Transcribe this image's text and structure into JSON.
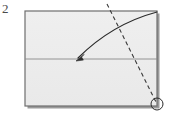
{
  "figure": {
    "type": "origami-instruction-diagram",
    "step_number": "2",
    "title": "",
    "background_color": "#ffffff"
  },
  "paper": {
    "name": "rectangular-sheet",
    "fill_color": "#ececec",
    "outline_color": "#6e6e6e",
    "outline_width": 1.2,
    "shadow_color": "#9a9a9a",
    "x": 25,
    "y": 11,
    "width": 132,
    "height": 95
  },
  "fold_line": {
    "name": "existing-horizontal-crease",
    "color": "#8a8a8a",
    "width": 0.9,
    "x1": 25,
    "y1": 59,
    "x2": 157,
    "y2": 59
  },
  "crease_line": {
    "name": "dashed-valley-fold-line",
    "style": "dashed",
    "color": "#3a3a3a",
    "width": 1.1,
    "dash_pattern": "4 3",
    "x1": 107,
    "y1": 4,
    "x2": 157,
    "y2": 104
  },
  "fold_arrow": {
    "name": "curved-fold-direction-arrow",
    "color": "#2b2b2b",
    "width": 1.2,
    "start_x": 157,
    "start_y": 12,
    "control_x": 112,
    "control_y": 24,
    "end_x": 78,
    "end_y": 58,
    "arrowhead_tip_x": 76,
    "arrowhead_tip_y": 61,
    "direction": "down-left"
  },
  "reference_marker": {
    "name": "corner-reference-circle",
    "color": "#2b2b2b",
    "width": 1.0,
    "center_x": 157,
    "center_y": 104,
    "radius": 6,
    "fill": "none"
  },
  "labels": {
    "step": "2"
  }
}
